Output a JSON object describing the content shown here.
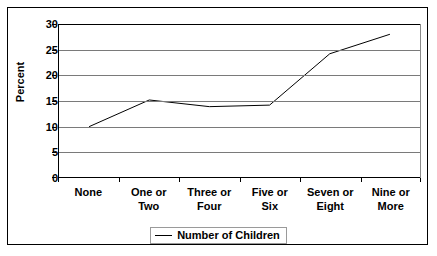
{
  "chart_data": {
    "type": "line",
    "title": "",
    "xlabel": "",
    "ylabel": "Percent",
    "categories": [
      "None",
      "One or\nTwo",
      "Three or\nFour",
      "Five or\nSix",
      "Seven or\nEight",
      "Nine or\nMore"
    ],
    "series": [
      {
        "name": "Number of Children",
        "values": [
          10.0,
          15.2,
          13.9,
          14.2,
          24.2,
          28.0
        ]
      }
    ],
    "ylim": [
      0,
      30
    ],
    "yticks": [
      0,
      5,
      10,
      15,
      20,
      25,
      30
    ],
    "ytick_labels": [
      "0",
      "5",
      "10",
      "15",
      "20",
      "25",
      "30"
    ],
    "grid": "horizontal",
    "legend_position": "bottom",
    "line_color": "#000000",
    "border_color": "#000000",
    "gridline_color": "#7a7a7a",
    "background_color": "#ffffff"
  },
  "legend": {
    "entries": [
      {
        "label": "Number of Children",
        "swatch": "line-swatch"
      }
    ]
  },
  "axis": {
    "y_title": "Percent"
  }
}
